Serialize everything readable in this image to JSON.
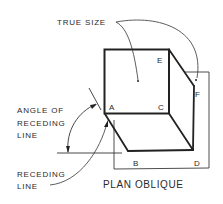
{
  "figure": {
    "title": "PLAN OBLIQUE",
    "callouts": {
      "true_size": "TRUE SIZE",
      "angle_of_receding_line": [
        "ANGLE OF",
        "RECEDING",
        "LINE"
      ],
      "receding_line": [
        "RECEDING",
        "LINE"
      ]
    },
    "vertex_labels": {
      "A": "A",
      "B": "B",
      "C": "C",
      "D": "D",
      "E": "E",
      "F": "F"
    },
    "colors": {
      "line": "#2a2a2a",
      "background": "#ffffff"
    }
  }
}
